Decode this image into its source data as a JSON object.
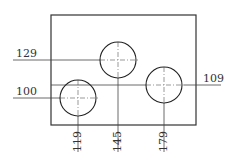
{
  "drawing": {
    "type": "technical-drawing",
    "stroke_color": "#222222",
    "plate": {
      "x": 51,
      "y": 15,
      "width": 145,
      "height": 110
    },
    "holes": [
      {
        "name": "left-hole",
        "cx": 78,
        "cy": 98,
        "r": 18
      },
      {
        "name": "middle-hole",
        "cx": 118,
        "cy": 60,
        "r": 18
      },
      {
        "name": "right-hole",
        "cx": 164,
        "cy": 85,
        "r": 18
      }
    ],
    "dimensions": {
      "horizontal": [
        {
          "label": "129",
          "y": 60,
          "x1": 13,
          "x2": 138
        },
        {
          "label": "100",
          "y": 98,
          "x1": 13,
          "x2": 100
        },
        {
          "label": "109",
          "y": 85,
          "x1": 51,
          "x2": 221
        }
      ],
      "vertical": [
        {
          "label": "119",
          "x": 78,
          "y1": 80,
          "y2": 152
        },
        {
          "label": "145",
          "x": 118,
          "y1": 42,
          "y2": 152
        },
        {
          "label": "179",
          "x": 164,
          "y1": 67,
          "y2": 152
        }
      ]
    }
  }
}
